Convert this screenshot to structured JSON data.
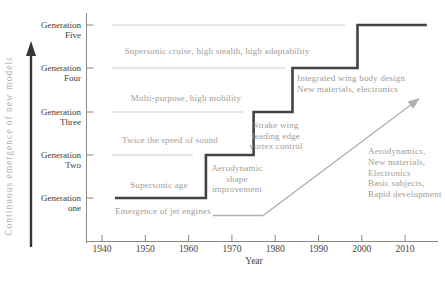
{
  "figure": {
    "x_axis_label": "Year",
    "y_axis_title": "Continuous emergence of new models"
  },
  "y_axis": {
    "labels": [
      {
        "line1": "Generation",
        "line2": "one"
      },
      {
        "line1": "Generation",
        "line2": "Two"
      },
      {
        "line1": "Generation",
        "line2": "Three"
      },
      {
        "line1": "Generation",
        "line2": "Four"
      },
      {
        "line1": "Generation",
        "line2": "Five"
      }
    ]
  },
  "annotations": [
    {
      "id": "jet-engines",
      "lines": [
        "Emergence of jet engines"
      ]
    },
    {
      "id": "supersonic-age",
      "lines": [
        "Supersonic age"
      ]
    },
    {
      "id": "twice-speed",
      "lines": [
        "Twice the speed of sound"
      ]
    },
    {
      "id": "multi-purpose",
      "lines": [
        "Multi-purpose, high mobility"
      ]
    },
    {
      "id": "supersonic-cruise",
      "lines": [
        "Supersonic cruise, high stealth, high adaptability"
      ]
    },
    {
      "id": "aero-shape",
      "lines": [
        "Aerodynamic",
        "shape",
        "improvement"
      ]
    },
    {
      "id": "strake-wing",
      "lines": [
        "Strake wing",
        "leading edge",
        "vortex control"
      ]
    },
    {
      "id": "integrated-wing",
      "lines": [
        "Integrated wing body design",
        "New materials, electronics"
      ]
    },
    {
      "id": "modern-tech",
      "lines": [
        "Aerodynamics,",
        "New materials,",
        "Electronics",
        "Basic subjects,",
        "Rapid development"
      ]
    }
  ],
  "colors": {
    "step_line": "#454341",
    "grid_line": "#c9c8c6",
    "axis_line": "#8a8784",
    "axis_text": "#45423f",
    "annotation_text": "#a19c95",
    "growth_arrow": "#b3b1ad",
    "emergence_arrow": "#383634",
    "y_title_text": "#b1afab"
  },
  "chart_data": {
    "type": "line",
    "subtype": "step",
    "title": "",
    "xlabel": "Year",
    "ylabel": "Continuous emergence of new models",
    "x_ticks": [
      1940,
      1950,
      1960,
      1970,
      1980,
      1990,
      2000,
      2010
    ],
    "y_tick_labels": [
      "Generation one",
      "Generation Two",
      "Generation Three",
      "Generation Four",
      "Generation Five"
    ],
    "xlim": [
      1936,
      2018
    ],
    "ylim_generations": [
      1,
      5
    ],
    "grid": "partial-horizontal",
    "legend": "none",
    "series": [
      {
        "name": "fighter-generation-steps",
        "points": [
          [
            1943,
            1
          ],
          [
            1964,
            1
          ],
          [
            1964,
            2
          ],
          [
            1975,
            2
          ],
          [
            1975,
            3
          ],
          [
            1984,
            3
          ],
          [
            1984,
            4
          ],
          [
            1999,
            4
          ],
          [
            1999,
            5
          ],
          [
            2015,
            5
          ]
        ]
      }
    ],
    "annotations_by_generation": {
      "1": [
        "Emergence of jet engines",
        "Supersonic age"
      ],
      "2": [
        "Twice the speed of sound",
        "Aerodynamic shape improvement"
      ],
      "3": [
        "Multi-purpose, high mobility",
        "Strake wing leading edge vortex control"
      ],
      "4": [
        "Supersonic cruise, high stealth, high adaptability",
        "Integrated wing body design, New materials, electronics"
      ],
      "5": [
        "Aerodynamics, New materials, Electronics, Basic subjects, Rapid development"
      ]
    }
  }
}
